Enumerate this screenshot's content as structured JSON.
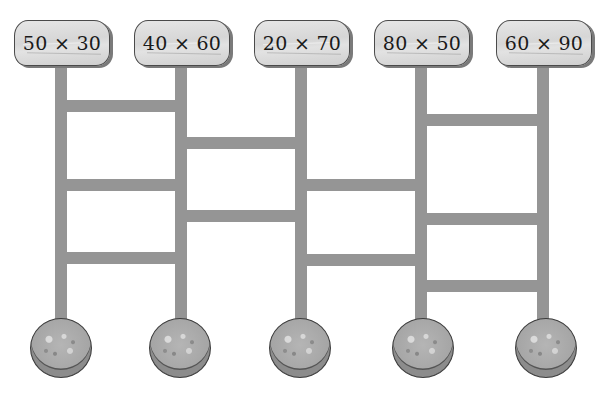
{
  "diagram": {
    "type": "ladder-game",
    "colors": {
      "background": "#ffffff",
      "ladder": "#959595",
      "sign_fill": "#d9d9d9",
      "sign_border": "#4a4a4a",
      "coin_fill": "#a8a8a8",
      "text": "#1a1a1a"
    },
    "signs": [
      {
        "label": "50 × 30"
      },
      {
        "label": "40 × 60"
      },
      {
        "label": "20 × 70"
      },
      {
        "label": "80 × 50"
      },
      {
        "label": "60 × 90"
      }
    ],
    "poles_x": [
      55,
      175,
      295,
      415,
      537
    ],
    "pole_top": 64,
    "pole_bottom": 322,
    "rungs": [
      {
        "from": 0,
        "to": 1,
        "y": 100
      },
      {
        "from": 0,
        "to": 1,
        "y": 179
      },
      {
        "from": 0,
        "to": 1,
        "y": 252
      },
      {
        "from": 1,
        "to": 2,
        "y": 137
      },
      {
        "from": 1,
        "to": 2,
        "y": 210
      },
      {
        "from": 2,
        "to": 3,
        "y": 179
      },
      {
        "from": 2,
        "to": 3,
        "y": 254
      },
      {
        "from": 3,
        "to": 4,
        "y": 114
      },
      {
        "from": 3,
        "to": 4,
        "y": 213
      },
      {
        "from": 3,
        "to": 4,
        "y": 280
      }
    ],
    "coins": [
      {
        "label": ""
      },
      {
        "label": ""
      },
      {
        "label": ""
      },
      {
        "label": ""
      },
      {
        "label": ""
      }
    ]
  }
}
